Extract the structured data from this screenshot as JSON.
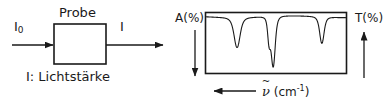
{
  "figure": {
    "title_absent": true,
    "left_diagram": {
      "incident_label": "I",
      "incident_subscript": "0",
      "sample_box_label": "Probe",
      "transmitted_label": "I",
      "caption": "I: Lichtstärke",
      "incident_arrow": "arrow-right",
      "transmitted_arrow": "arrow-right"
    },
    "right_plot": {
      "left_axis_label": "A(%)",
      "left_axis_arrow": "arrow-down",
      "right_axis_label": "T(%)",
      "right_axis_arrow": "arrow-up",
      "x_axis_symbol": "ν",
      "x_axis_tilde": "~",
      "x_axis_unit": "(cm",
      "x_axis_unit_exp": "-1",
      "x_axis_unit_close": ")",
      "x_axis_arrow": "arrow-left"
    }
  },
  "chart_data": {
    "type": "line",
    "xlabel": "ν̃ (cm⁻¹)",
    "ylabel": "T(%)",
    "ylabel_secondary": "A(%)",
    "x_direction": "decreasing",
    "grid": false,
    "legend": "none",
    "xlim": [
      0,
      100
    ],
    "ylim": [
      0,
      100
    ],
    "baseline_transmittance": 96,
    "bands": [
      {
        "name": "band-1",
        "x_rel": 22,
        "depth_pct": 52,
        "width_rel": 3.0
      },
      {
        "name": "band-2-shoulder",
        "x_rel": 45,
        "depth_pct": 40,
        "width_rel": 1.4
      },
      {
        "name": "band-2-main",
        "x_rel": 48,
        "depth_pct": 86,
        "width_rel": 2.0
      },
      {
        "name": "band-3",
        "x_rel": 83,
        "depth_pct": 46,
        "width_rel": 2.2
      }
    ],
    "x": [
      0,
      4,
      8,
      12,
      16,
      19,
      21,
      22,
      23,
      25,
      28,
      33,
      38,
      42,
      44,
      45,
      46,
      47,
      48,
      49,
      50,
      53,
      58,
      63,
      68,
      73,
      78,
      80,
      82,
      83,
      84,
      86,
      89,
      93,
      97,
      100
    ],
    "y": [
      95,
      96,
      96,
      96,
      95,
      92,
      70,
      44,
      70,
      92,
      95,
      95,
      95,
      94,
      78,
      56,
      80,
      60,
      14,
      55,
      82,
      93,
      94,
      95,
      95,
      95,
      94,
      92,
      72,
      50,
      74,
      93,
      95,
      95,
      95,
      95
    ]
  }
}
